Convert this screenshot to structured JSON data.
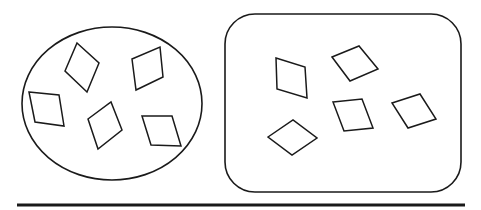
{
  "diagram": {
    "background": "#ffffff",
    "stroke_color": "#1a1a1a",
    "groups": [
      {
        "name": "ellipse-group",
        "container": {
          "shape": "ellipse",
          "cx": 112,
          "cy": 103.5,
          "rx": 90,
          "ry": 76.5
        },
        "item_shape": "rhombus",
        "item_count": 5,
        "items": [
          {
            "points": "77,43 99,63 87,92 65,71"
          },
          {
            "points": "132,59 160,47 163,77 136,90"
          },
          {
            "points": "29,92 59,95 64,126 35,122"
          },
          {
            "points": "88,119 111,102 122,130 98,149"
          },
          {
            "points": "142,116 172,116 181,146 151,145"
          }
        ]
      },
      {
        "name": "rounded-rect-group",
        "container": {
          "shape": "rounded-rectangle",
          "x": 225,
          "y": 14,
          "width": 236,
          "height": 178,
          "radius": 30
        },
        "item_shape": "rhombus",
        "item_count": 5,
        "items": [
          {
            "points": "276,58 305,67 307,98 277,89"
          },
          {
            "points": "332,57 359,46 378,69 350,81"
          },
          {
            "points": "333,102 362,99 373,128 344,131"
          },
          {
            "points": "392,103 420,94 436,119 408,128"
          },
          {
            "points": "268,137 293,120 317,138 292,155"
          }
        ]
      }
    ],
    "baseline": {
      "x1": 17,
      "y1": 205,
      "x2": 465,
      "y2": 205,
      "stroke_width": 3
    }
  }
}
